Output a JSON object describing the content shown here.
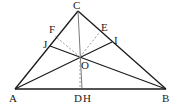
{
  "diagram": {
    "type": "geometry-triangle",
    "points": {
      "A": {
        "label": "A",
        "x": 15,
        "y": 89
      },
      "B": {
        "label": "B",
        "x": 166,
        "y": 89
      },
      "C": {
        "label": "C",
        "x": 78,
        "y": 11
      },
      "O": {
        "label": "O",
        "x": 80,
        "y": 57
      },
      "D": {
        "label": "D",
        "x": 80,
        "y": 89
      },
      "H": {
        "label": "H",
        "x": 82,
        "y": 89
      },
      "E": {
        "label": "E",
        "x": 99,
        "y": 32
      },
      "F": {
        "label": "F",
        "x": 55,
        "y": 35
      },
      "I": {
        "label": "I",
        "x": 112,
        "y": 42
      },
      "J": {
        "label": "J",
        "x": 50,
        "y": 46
      }
    },
    "labels": [
      "C",
      "F",
      "E",
      "J",
      "I",
      "O",
      "A",
      "D",
      "H",
      "B"
    ],
    "solid_segments": [
      [
        "A",
        "B"
      ],
      [
        "A",
        "C"
      ],
      [
        "B",
        "C"
      ],
      [
        "C",
        "H"
      ],
      [
        "A",
        "I"
      ],
      [
        "B",
        "J"
      ]
    ],
    "dashed_segments": [
      [
        "O",
        "F"
      ],
      [
        "O",
        "E"
      ],
      [
        "O",
        "D"
      ]
    ],
    "colors": {
      "line": "#1a1a1a",
      "dashed": "#9a9a9a",
      "background": "#ffffff"
    }
  }
}
